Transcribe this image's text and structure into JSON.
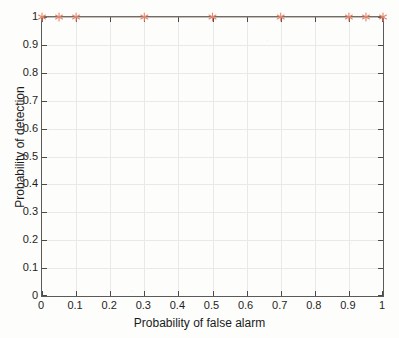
{
  "figure": {
    "background_color": "#fdfdfc",
    "axis_color": "#5a5a5a",
    "grid_color": "#e9e9e9",
    "text_color": "#1e1e1e"
  },
  "chart_data": {
    "type": "line",
    "title": "",
    "xlabel": "Probability of false alarm",
    "ylabel": "Probability of detection",
    "xlim": [
      0,
      1
    ],
    "ylim": [
      0,
      1
    ],
    "grid": true,
    "legend": null,
    "series": [
      {
        "name": "ROC curve",
        "color": "#e8846a",
        "line_color": "#8a7d76",
        "marker": "asterisk",
        "marker_color": "#e8846a",
        "x": [
          0,
          0.05,
          0.1,
          0.3,
          0.5,
          0.7,
          0.9,
          0.95,
          1
        ],
        "y": [
          1,
          1,
          1,
          1,
          1,
          1,
          1,
          1,
          1
        ]
      }
    ],
    "xticks": [
      0,
      0.1,
      0.2,
      0.3,
      0.4,
      0.5,
      0.6,
      0.7,
      0.8,
      0.9,
      1
    ],
    "xtick_labels": [
      "0",
      "0.1",
      "0.2",
      "0.3",
      "0.4",
      "0.5",
      "0.6",
      "0.7",
      "0.8",
      "0.9",
      "1"
    ],
    "yticks": [
      0,
      0.1,
      0.2,
      0.3,
      0.4,
      0.5,
      0.6,
      0.7,
      0.8,
      0.9,
      1
    ],
    "ytick_labels": [
      "0",
      "0.1",
      "0.2",
      "0.3",
      "0.4",
      "0.5",
      "0.6",
      "0.7",
      "0.8",
      "0.9",
      "1"
    ]
  }
}
